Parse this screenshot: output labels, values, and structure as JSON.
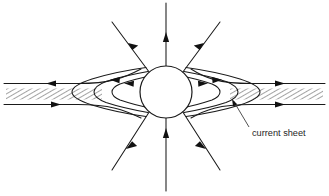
{
  "figure": {
    "background_color": "#ffffff",
    "line_color": "#1a1a1a",
    "hatch_color": "#555555",
    "width": 329,
    "height": 196
  },
  "labels": {
    "current_sheet": "current sheet"
  },
  "diagram_data": {
    "type": "field-line-schematic",
    "central_body": {
      "name": "central-sphere",
      "cx": 166,
      "cy": 92,
      "r": 26
    },
    "current_sheet": {
      "name": "current-sheet-band",
      "left_segment": {
        "x_start": 6,
        "x_end": 104,
        "y_top": 88,
        "y_bottom": 100
      },
      "right_segment": {
        "x_start": 228,
        "x_end": 323,
        "y_top": 88,
        "y_bottom": 100
      },
      "hatch_angle_deg": 60,
      "hatch_spacing": 3
    },
    "closed_loops_left": [
      {
        "name": "loop-left-outer",
        "tip_x": 72
      },
      {
        "name": "loop-left-middle",
        "tip_x": 96
      },
      {
        "name": "loop-left-inner",
        "tip_x": 114
      }
    ],
    "closed_loops_right": [
      {
        "name": "loop-right-outer",
        "tip_x": 260
      },
      {
        "name": "loop-right-middle",
        "tip_x": 236
      },
      {
        "name": "loop-right-inner",
        "tip_x": 218
      }
    ],
    "radial_lines": [
      {
        "name": "radial-up",
        "angle_deg": 90,
        "direction": "outward",
        "arrow_at": 0.55
      },
      {
        "name": "radial-up-left",
        "angle_deg": 125,
        "direction": "outward",
        "arrow_at": 0.5
      },
      {
        "name": "radial-up-right",
        "angle_deg": 55,
        "direction": "outward",
        "arrow_at": 0.5
      },
      {
        "name": "radial-down",
        "angle_deg": 270,
        "direction": "inward",
        "arrow_at": 0.55
      },
      {
        "name": "radial-down-left",
        "angle_deg": 235,
        "direction": "outward",
        "arrow_at": 0.5
      },
      {
        "name": "radial-down-right",
        "angle_deg": 305,
        "direction": "outward",
        "arrow_at": 0.5
      }
    ],
    "flow_arrows": [
      {
        "name": "arrow-outer-top-left",
        "x": 53,
        "y": 83,
        "direction": "left"
      },
      {
        "name": "arrow-outer-bottom-left",
        "x": 53,
        "y": 104,
        "direction": "right"
      },
      {
        "name": "arrow-outer-top-right",
        "x": 278,
        "y": 83,
        "direction": "right"
      },
      {
        "name": "arrow-outer-bottom-right",
        "x": 278,
        "y": 104,
        "direction": "right"
      },
      {
        "name": "arrow-loop-left-mid",
        "x": 118,
        "y": 79,
        "direction": "left"
      },
      {
        "name": "arrow-loop-left-inner",
        "x": 108,
        "y": 86,
        "direction": "left"
      },
      {
        "name": "arrow-loop-right-mid",
        "x": 214,
        "y": 79,
        "direction": "right"
      },
      {
        "name": "arrow-loop-right-inner",
        "x": 224,
        "y": 86,
        "direction": "right"
      }
    ],
    "annotation": {
      "name": "current-sheet-callout",
      "text_x": 252,
      "text_y": 133,
      "leader_from": [
        249,
        128
      ],
      "leader_to": [
        232,
        100
      ]
    }
  }
}
